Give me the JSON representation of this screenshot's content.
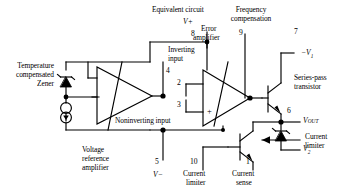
{
  "figure": {
    "title": "Equivalent circuit",
    "type": "voltage-regulator-equivalent-circuit"
  },
  "labels": {
    "equivalent_circuit": "Equivalent circuit",
    "frequency_compensation_l1": "Frequency",
    "frequency_compensation_l2": "compensation",
    "error_amplifier_l1": "Error",
    "error_amplifier_l2": "amplifier",
    "inverting_input_l1": "Inverting",
    "inverting_input_l2": "input",
    "noninverting_input": "Noninverting input",
    "temperature_compensated_l1": "Temperature",
    "temperature_compensated_l2": "compensated",
    "temperature_compensated_l3": "Zener",
    "voltage_reference_l1": "Voltage",
    "voltage_reference_l2": "reference",
    "voltage_reference_l3": "amplifier",
    "series_pass_l1": "Series-pass",
    "series_pass_l2": "transistor",
    "current_limiter_left_l1": "Current",
    "current_limiter_left_l2": "limiter",
    "current_sense_l1": "Current",
    "current_sense_l2": "sense",
    "current_limiter_right_l1": "Current",
    "current_limiter_right_l2": "limiter"
  },
  "pins": {
    "p8": "8",
    "p4": "4",
    "p9": "9",
    "p7": "7",
    "p2": "2",
    "p3": "3",
    "p6": "6",
    "p5": "5",
    "p10": "10",
    "p1": "1"
  },
  "nets": {
    "v_plus": "V+",
    "v_minus": "V−",
    "v_out": "V",
    "v_out_sub": "OUT",
    "minus_v1": "−V",
    "minus_v1_sub": "1",
    "v2": "V",
    "v2_sub": "2"
  },
  "colors": {
    "ink": "#000000",
    "paper": "#ffffff"
  }
}
